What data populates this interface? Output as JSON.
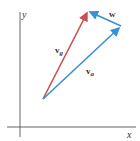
{
  "diagram": {
    "axes": {
      "x_label": "x",
      "y_label": "y",
      "color": "#666666"
    },
    "vectors": [
      {
        "name": "v_g",
        "label": "v",
        "subscript": "g",
        "color": "#c9504f",
        "from": [
          43,
          99
        ],
        "to": [
          88,
          11
        ]
      },
      {
        "name": "v_a",
        "label": "v",
        "subscript": "a",
        "color": "#3a8fd6",
        "from": [
          43,
          99
        ],
        "to": [
          121,
          26
        ]
      },
      {
        "name": "w",
        "label": "w",
        "subscript": "",
        "color": "#3a8fd6",
        "from": [
          121,
          26
        ],
        "to": [
          88,
          11
        ]
      }
    ]
  }
}
